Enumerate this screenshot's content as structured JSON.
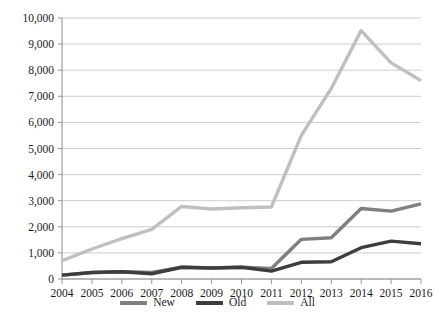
{
  "chart_data": {
    "type": "line",
    "title": "",
    "subtitle": "",
    "xlabel": "",
    "ylabel": "",
    "categories": [
      "2004",
      "2005",
      "2006",
      "2007",
      "2008",
      "2009",
      "2010",
      "2011",
      "2012",
      "2013",
      "2014",
      "2015",
      "2016"
    ],
    "series": [
      {
        "name": "New",
        "color": "#7f7f7f",
        "values": [
          150,
          250,
          280,
          250,
          450,
          420,
          450,
          400,
          1520,
          1580,
          2700,
          2600,
          2880
        ]
      },
      {
        "name": "Old",
        "color": "#3d3d3d",
        "values": [
          150,
          250,
          280,
          200,
          450,
          420,
          450,
          300,
          640,
          660,
          1200,
          1450,
          1350
        ]
      },
      {
        "name": "All",
        "color": "#bfbfbf",
        "values": [
          700,
          1150,
          1550,
          1900,
          2780,
          2680,
          2730,
          2760,
          5500,
          7300,
          9520,
          8280,
          7600
        ]
      }
    ],
    "ylim": [
      0,
      10000
    ],
    "ytick_values": [
      0,
      1000,
      2000,
      3000,
      4000,
      5000,
      6000,
      7000,
      8000,
      9000,
      10000
    ],
    "ytick_labels": [
      "0",
      "1,000",
      "2,000",
      "3,000",
      "4,000",
      "5,000",
      "6,000",
      "7,000",
      "8,000",
      "9,000",
      "10,000"
    ],
    "grid": true,
    "grid_axis": "y",
    "legend_position": "bottom",
    "legend_entries": [
      {
        "label": "New",
        "color": "#7f7f7f"
      },
      {
        "label": "Old",
        "color": "#3d3d3d"
      },
      {
        "label": "All",
        "color": "#bfbfbf"
      }
    ],
    "plot_area": {
      "left": 62,
      "right": 421,
      "top": 18,
      "bottom": 279
    }
  }
}
